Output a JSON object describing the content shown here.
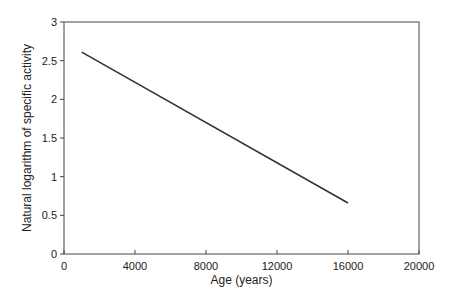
{
  "chart_data": {
    "type": "line",
    "title": "",
    "xlabel": "Age (years)",
    "ylabel": "Natural logarithm of specific activity",
    "xlim": [
      0,
      20000
    ],
    "ylim": [
      0,
      3
    ],
    "xticks": [
      0,
      4000,
      8000,
      12000,
      16000,
      20000
    ],
    "yticks": [
      0,
      0.5,
      1,
      1.5,
      2,
      2.5,
      3
    ],
    "xtick_labels": [
      "0",
      "4000",
      "8000",
      "12000",
      "16000",
      "20000"
    ],
    "ytick_labels": [
      "0",
      "0.5",
      "1",
      "1.5",
      "2",
      "2.5",
      "3"
    ],
    "grid": false,
    "legend": null,
    "series": [
      {
        "name": "ln(specific activity)",
        "x": [
          1000,
          16000
        ],
        "y": [
          2.61,
          0.66
        ],
        "color": "#333333"
      }
    ]
  }
}
